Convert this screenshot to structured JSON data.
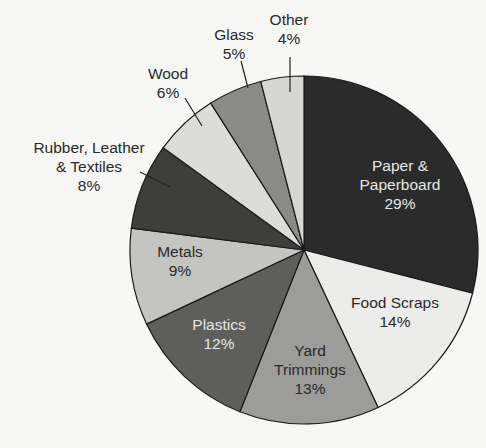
{
  "chart_data": {
    "type": "pie",
    "title": "",
    "start_angle_deg": 0,
    "direction": "clockwise",
    "slices": [
      {
        "label": "Paper & Paperboard",
        "lines": [
          "Paper &",
          "Paperboard",
          "29%"
        ],
        "value": 29,
        "color": "#2b2b2b",
        "text_color": "#e6e6e6"
      },
      {
        "label": "Food Scraps",
        "lines": [
          "Food Scraps",
          "14%"
        ],
        "value": 14,
        "color": "#ececea",
        "text_color": "#2a2a2a"
      },
      {
        "label": "Yard Trimmings",
        "lines": [
          "Yard",
          "Trimmings",
          "13%"
        ],
        "value": 13,
        "color": "#9c9c9a",
        "text_color": "#2a2a2a"
      },
      {
        "label": "Plastics",
        "lines": [
          "Plastics",
          "12%"
        ],
        "value": 12,
        "color": "#5e5e5c",
        "text_color": "#e6e6e6"
      },
      {
        "label": "Metals",
        "lines": [
          "Metals",
          "9%"
        ],
        "value": 9,
        "color": "#c4c4c2",
        "text_color": "#2a2a2a"
      },
      {
        "label": "Rubber, Leather & Textiles",
        "lines": [
          "Rubber, Leather",
          "& Textiles",
          "8%"
        ],
        "value": 8,
        "color": "#3e3e3c",
        "text_color": "#2a2a2a"
      },
      {
        "label": "Wood",
        "lines": [
          "Wood",
          "6%"
        ],
        "value": 6,
        "color": "#dcdcda",
        "text_color": "#2a2a2a"
      },
      {
        "label": "Glass",
        "lines": [
          "Glass",
          "5%"
        ],
        "value": 5,
        "color": "#8a8a88",
        "text_color": "#2a2a2a"
      },
      {
        "label": "Other",
        "lines": [
          "Other",
          "4%"
        ],
        "value": 4,
        "color": "#d6d6d4",
        "text_color": "#2a2a2a"
      }
    ],
    "categories": [
      "Paper & Paperboard",
      "Food Scraps",
      "Yard Trimmings",
      "Plastics",
      "Metals",
      "Rubber, Leather & Textiles",
      "Wood",
      "Glass",
      "Other"
    ],
    "values": [
      29,
      14,
      13,
      12,
      9,
      8,
      6,
      5,
      4
    ],
    "unit": "%"
  }
}
